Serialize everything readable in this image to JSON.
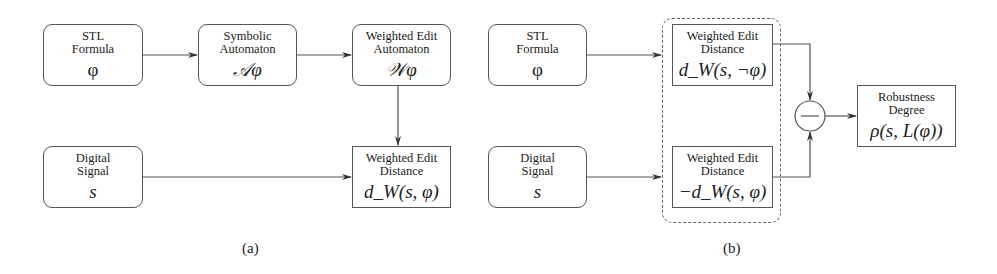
{
  "diagram_a": {
    "caption": "(a)",
    "nodes": {
      "stl_formula": {
        "title_1": "STL",
        "title_2": "Formula",
        "symbol": "φ"
      },
      "symbolic_automaton": {
        "title_1": "Symbolic",
        "title_2": "Automaton",
        "symbol": "𝒜φ"
      },
      "weighted_edit_automaton": {
        "title_1": "Weighted Edit",
        "title_2": "Automaton",
        "symbol": "𝒲φ"
      },
      "digital_signal": {
        "title_1": "Digital",
        "title_2": "Signal",
        "symbol": "s"
      },
      "weighted_edit_distance": {
        "title_1": "Weighted Edit",
        "title_2": "Distance",
        "symbol": "d_W(s, φ)"
      }
    },
    "edges": [
      [
        "stl_formula",
        "symbolic_automaton"
      ],
      [
        "symbolic_automaton",
        "weighted_edit_automaton"
      ],
      [
        "weighted_edit_automaton",
        "weighted_edit_distance"
      ],
      [
        "digital_signal",
        "weighted_edit_distance"
      ]
    ]
  },
  "diagram_b": {
    "caption": "(b)",
    "nodes": {
      "stl_formula": {
        "title_1": "STL",
        "title_2": "Formula",
        "symbol": "φ"
      },
      "digital_signal": {
        "title_1": "Digital",
        "title_2": "Signal",
        "symbol": "s"
      },
      "wed_negation": {
        "title_1": "Weighted Edit",
        "title_2": "Distance",
        "symbol": "d_W(s, ¬φ)"
      },
      "wed_negative": {
        "title_1": "Weighted Edit",
        "title_2": "Distance",
        "symbol": "−d_W(s, φ)"
      },
      "subtract": {
        "symbol": "−"
      },
      "robustness_degree": {
        "title_1": "Robustness",
        "title_2": "Degree",
        "symbol": "ρ(s, L(φ))"
      }
    },
    "group": "dashed-box around both Weighted Edit Distance nodes",
    "edges": [
      [
        "stl_formula",
        "wed_negation"
      ],
      [
        "digital_signal",
        "wed_negative"
      ],
      [
        "wed_negation",
        "subtract"
      ],
      [
        "wed_negative",
        "subtract"
      ],
      [
        "subtract",
        "robustness_degree"
      ]
    ]
  },
  "colors": {
    "stroke": "#555555",
    "text": "#222222",
    "background": "#ffffff"
  }
}
